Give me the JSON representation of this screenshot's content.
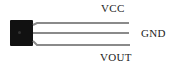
{
  "diagram": {
    "component": "3-pin TO-92 sensor package",
    "body_color": "#111111",
    "lead_color": "#8a8a8a",
    "pins": [
      {
        "label": "VCC",
        "position": "top"
      },
      {
        "label": "GND",
        "position": "middle"
      },
      {
        "label": "VOUT",
        "position": "bottom"
      }
    ]
  }
}
